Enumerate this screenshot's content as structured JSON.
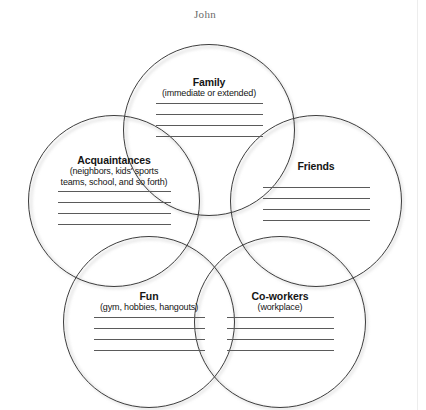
{
  "page": {
    "title": "John",
    "background_color": "#ffffff",
    "stroke_color": "#3d3d3d",
    "text_color": "#151515",
    "title_color": "#6b6b6b",
    "rule_color": "#5a5a5a"
  },
  "diagram": {
    "type": "venn-circles",
    "circle_count": 5,
    "circles": [
      {
        "id": "family",
        "title": "Family",
        "subtitle": "(immediate or extended)",
        "write_lines": 4,
        "cx": 209,
        "cy": 130,
        "r": 86
      },
      {
        "id": "acquaintances",
        "title": "Acquaintances",
        "subtitle": "(neighbors, kids' sports\nteams, school, and so forth)",
        "write_lines": 4,
        "cx": 114,
        "cy": 201,
        "r": 86
      },
      {
        "id": "friends",
        "title": "Friends",
        "subtitle": "",
        "write_lines": 4,
        "cx": 316,
        "cy": 201,
        "r": 86
      },
      {
        "id": "fun",
        "title": "Fun",
        "subtitle": "(gym, hobbies, hangouts)",
        "write_lines": 4,
        "cx": 149,
        "cy": 322,
        "r": 86
      },
      {
        "id": "co-workers",
        "title": "Co-workers",
        "subtitle": "(workplace)",
        "write_lines": 4,
        "cx": 280,
        "cy": 322,
        "r": 86
      }
    ]
  }
}
